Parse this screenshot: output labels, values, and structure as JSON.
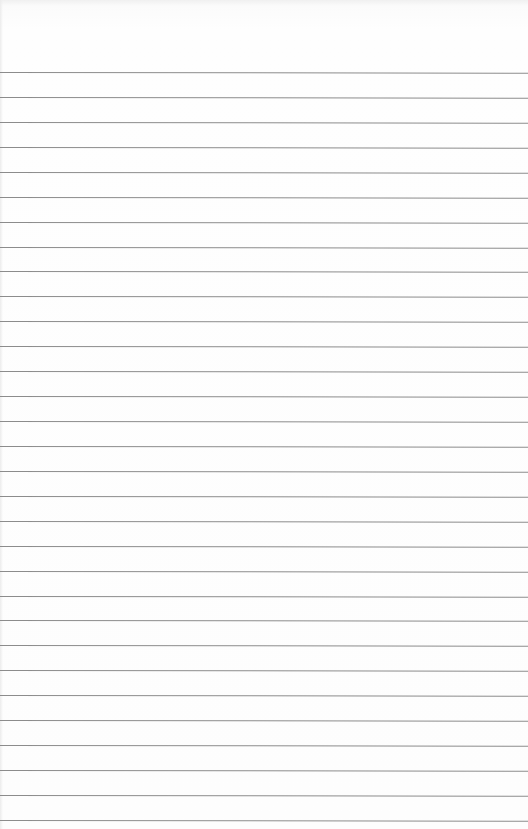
{
  "page": {
    "type": "lined-paper",
    "background_color": "#fdfdfd",
    "rule_color": "#8c8c8c",
    "first_rule_y": 72,
    "rule_spacing": 24.93,
    "rule_count": 31
  }
}
